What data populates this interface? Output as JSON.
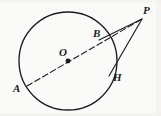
{
  "figure": {
    "background_color": "#fafaf8",
    "stroke_color": "#1c1c1c",
    "labels": {
      "A": "A",
      "O": "O",
      "B": "B",
      "H": "H",
      "P": "P"
    }
  },
  "chart_data": {
    "type": "diagram",
    "xlabel": "",
    "ylabel": "",
    "xlim": [
      0,
      161
    ],
    "ylim": [
      0,
      116
    ],
    "grid": false,
    "legend": null,
    "shapes": [
      {
        "name": "circle",
        "kind": "circle",
        "center": [
          68,
          61
        ],
        "radius": 49,
        "stroke": "#1c1c1c",
        "stroke_width": 1.3,
        "fill": "none",
        "style": "solid"
      },
      {
        "name": "secant-A-O-B-P",
        "kind": "line",
        "from": [
          27,
          86
        ],
        "to": [
          142,
          19
        ],
        "stroke": "#1c1c1c",
        "stroke_width": 1.1,
        "style": "dashed",
        "dash_pattern": "6,3"
      },
      {
        "name": "tangent-P-H",
        "kind": "line",
        "from": [
          142,
          19
        ],
        "to": [
          109,
          76
        ],
        "stroke": "#1c1c1c",
        "stroke_width": 1.1,
        "style": "solid"
      },
      {
        "name": "chord-B-P-edge",
        "kind": "line",
        "from": [
          142,
          19
        ],
        "to": [
          99,
          40
        ],
        "stroke": "#1c1c1c",
        "stroke_width": 1.1,
        "style": "solid"
      }
    ],
    "points": [
      {
        "name": "A",
        "label": "A",
        "coords": [
          27,
          86
        ],
        "marker": "none",
        "label_pos": [
          13,
          83
        ]
      },
      {
        "name": "O",
        "label": "O",
        "coords": [
          68,
          61
        ],
        "marker": "dot",
        "label_pos": [
          59,
          47
        ]
      },
      {
        "name": "B",
        "label": "B",
        "coords": [
          99,
          40
        ],
        "marker": "none",
        "label_pos": [
          93,
          28
        ]
      },
      {
        "name": "H",
        "label": "H",
        "coords": [
          109,
          76
        ],
        "marker": "none",
        "label_pos": [
          113,
          72
        ]
      },
      {
        "name": "P",
        "label": "P",
        "coords": [
          142,
          19
        ],
        "marker": "none",
        "label_pos": [
          143,
          5
        ]
      }
    ]
  }
}
